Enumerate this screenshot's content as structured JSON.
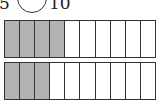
{
  "comparison": {
    "left_denominator": "5",
    "right_denominator": "10",
    "comparison_symbol": ""
  },
  "tape_diagrams": [
    {
      "name": "top-bar",
      "total_cells": 10,
      "shaded_cells": 4,
      "shade_color": "#b3b3b3"
    },
    {
      "name": "bottom-bar",
      "total_cells": 10,
      "shaded_cells": 3,
      "shade_color": "#b3b3b3"
    }
  ]
}
